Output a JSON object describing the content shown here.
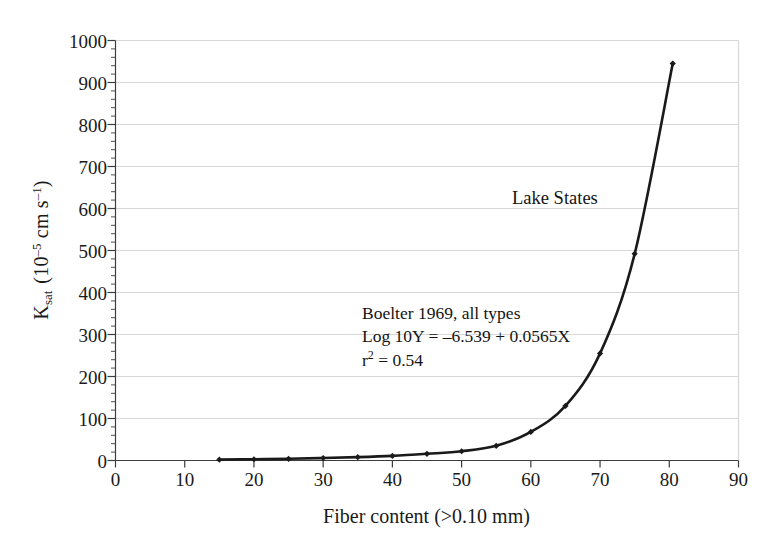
{
  "chart_data": {
    "type": "line",
    "title": "",
    "xlabel": "Fiber content (>0.10 mm)",
    "ylabel": "K_sat (10^-5 cm s^-1)",
    "ylabel_parts": {
      "symbol": "K",
      "subscript": "sat",
      "unit_open": "(10",
      "unit_exp": "–5",
      "unit_rest": "cm s",
      "unit_exp2": "–1",
      "unit_close": ")"
    },
    "xlim": [
      0,
      90
    ],
    "ylim": [
      0,
      1000
    ],
    "xticks": [
      0,
      10,
      20,
      30,
      40,
      50,
      60,
      70,
      80,
      90
    ],
    "yticks": [
      0,
      100,
      200,
      300,
      400,
      500,
      600,
      700,
      800,
      900,
      1000
    ],
    "x_minor_tick_step": 2,
    "y_minor_tick_step": 20,
    "grid": "horizontal",
    "legend": "none",
    "series": [
      {
        "name": "Lake States",
        "marker": "diamond",
        "line_color": "#1a1a1a",
        "x": [
          15,
          20,
          25,
          30,
          35,
          40,
          45,
          50,
          55,
          60,
          65,
          70,
          75,
          80.5
        ],
        "values": [
          2,
          3,
          4,
          6,
          8,
          11,
          16,
          22,
          35,
          68,
          130,
          255,
          492,
          945
        ]
      }
    ],
    "annotations": [
      {
        "name": "series-label",
        "text": "Lake States",
        "x_data": 60.5,
        "y_data": 620
      },
      {
        "name": "regression-stats",
        "lines": [
          "Boelter 1969, all types",
          "Log 10Y = –6.539 + 0.0565X",
          "r2 = 0.54"
        ],
        "line1": "Boelter 1969, all types",
        "line2": "Log 10Y = –6.539 + 0.0565X",
        "line3_pre": "r",
        "line3_sup": "2",
        "line3_post": " = 0.54"
      }
    ]
  },
  "style": {
    "axis_color": "#3c3c3c",
    "grid_color": "#d8d8d8",
    "curve_color": "#1a1a1a",
    "background": "#ffffff",
    "text_color": "#1a1a1a"
  }
}
